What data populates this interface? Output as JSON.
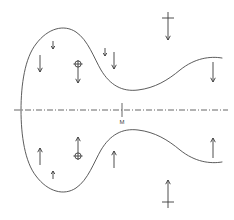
{
  "figure": {
    "background_color": "#ffffff",
    "curve_color": "#4a4a4a",
    "arrow_color": "#3a3a3a",
    "axis_color": "#555555",
    "width": 234,
    "height": 220
  },
  "axis": {
    "name": "horizontal-centerline",
    "style": "dash-dot",
    "y": 110,
    "x_start": 14,
    "x_end": 228,
    "tick": {
      "name": "center-tick",
      "x": 122,
      "half_height": 7
    },
    "label": {
      "text": "M",
      "x": 122,
      "y": 124
    }
  },
  "chart_data": {
    "type": "line",
    "xlabel": "",
    "ylabel": "",
    "xlim": [
      0,
      234
    ],
    "ylim": [
      0,
      220
    ],
    "grid": false,
    "legend": null,
    "annotations": [
      {
        "text": "M",
        "x": 122,
        "y": 124
      }
    ],
    "series": [
      {
        "name": "upper-boundary-curve",
        "path": "M 21,110 C 21,84 25,58 36,44 C 48,28 64,24 76,32 C 88,40 94,58 101,70 C 110,85 122,92 138,90 C 155,88 168,80 180,70 C 195,58 210,56 222,58",
        "points": [
          [
            21,
            110
          ],
          [
            24,
            88
          ],
          [
            30,
            66
          ],
          [
            40,
            47
          ],
          [
            54,
            36
          ],
          [
            68,
            33
          ],
          [
            80,
            40
          ],
          [
            90,
            54
          ],
          [
            99,
            68
          ],
          [
            110,
            81
          ],
          [
            124,
            89
          ],
          [
            140,
            89
          ],
          [
            156,
            84
          ],
          [
            172,
            74
          ],
          [
            190,
            63
          ],
          [
            206,
            57
          ],
          [
            222,
            58
          ]
        ]
      },
      {
        "name": "lower-boundary-curve",
        "path": "M 21,110 C 21,136 25,162 36,176 C 48,192 64,196 76,188 C 88,180 94,162 101,150 C 110,135 122,128 138,130 C 155,132 168,140 180,150 C 195,162 210,164 222,162",
        "points": [
          [
            21,
            110
          ],
          [
            24,
            132
          ],
          [
            30,
            154
          ],
          [
            40,
            173
          ],
          [
            54,
            184
          ],
          [
            68,
            187
          ],
          [
            80,
            180
          ],
          [
            90,
            166
          ],
          [
            99,
            152
          ],
          [
            110,
            139
          ],
          [
            124,
            131
          ],
          [
            140,
            131
          ],
          [
            156,
            136
          ],
          [
            172,
            146
          ],
          [
            190,
            157
          ],
          [
            206,
            163
          ],
          [
            222,
            162
          ]
        ]
      }
    ]
  },
  "arrows": [
    {
      "name": "arrow-upper-left-small-down",
      "kind": "small-down-arrow",
      "direction": "down",
      "x": 53,
      "y_top": 41,
      "length": 8,
      "crossbar": false,
      "circle": false
    },
    {
      "name": "arrow-upper-left-down",
      "kind": "plain-down-arrow",
      "direction": "down",
      "x": 40,
      "y_top": 55,
      "length": 17,
      "crossbar": false,
      "circle": false
    },
    {
      "name": "arrow-upper-mid-circle-down",
      "kind": "circled-down-arrow",
      "direction": "down",
      "x": 78,
      "y_top": 60,
      "length": 23,
      "crossbar": false,
      "circle": true,
      "circle_offset": 4
    },
    {
      "name": "arrow-upper-center-small-down",
      "kind": "small-down-arrow",
      "direction": "down",
      "x": 105,
      "y_top": 48,
      "length": 8,
      "crossbar": false,
      "circle": false
    },
    {
      "name": "arrow-upper-center-down",
      "kind": "plain-down-arrow",
      "direction": "down",
      "x": 114,
      "y_top": 52,
      "length": 17,
      "crossbar": false,
      "circle": false
    },
    {
      "name": "arrow-top-outer-crossed-down",
      "kind": "crossed-down-arrow",
      "direction": "down",
      "x": 168,
      "y_top": 12,
      "length": 28,
      "crossbar": true,
      "crossbar_offset": 6,
      "crossbar_width": 12,
      "circle": false
    },
    {
      "name": "arrow-upper-right-down",
      "kind": "plain-down-arrow",
      "direction": "down",
      "x": 213,
      "y_top": 62,
      "length": 20,
      "crossbar": false,
      "circle": false
    },
    {
      "name": "arrow-lower-left-small-up",
      "kind": "small-up-arrow",
      "direction": "up",
      "x": 53,
      "y_top": 171,
      "length": 8,
      "crossbar": false,
      "circle": false
    },
    {
      "name": "arrow-lower-left-up",
      "kind": "plain-up-arrow",
      "direction": "up",
      "x": 40,
      "y_top": 148,
      "length": 17,
      "crossbar": false,
      "circle": false
    },
    {
      "name": "arrow-lower-mid-circle-up",
      "kind": "circled-up-arrow",
      "direction": "up",
      "x": 78,
      "y_top": 137,
      "length": 23,
      "crossbar": false,
      "circle": true,
      "circle_offset": 19
    },
    {
      "name": "arrow-lower-center-up",
      "kind": "plain-up-arrow",
      "direction": "up",
      "x": 114,
      "y_top": 151,
      "length": 17,
      "crossbar": false,
      "circle": false
    },
    {
      "name": "arrow-bottom-outer-crossed-up",
      "kind": "crossed-up-arrow",
      "direction": "up",
      "x": 168,
      "y_top": 180,
      "length": 28,
      "crossbar": true,
      "crossbar_offset": 22,
      "crossbar_width": 12,
      "circle": false
    },
    {
      "name": "arrow-lower-right-up",
      "kind": "plain-up-arrow",
      "direction": "up",
      "x": 213,
      "y_top": 138,
      "length": 20,
      "crossbar": false,
      "circle": false
    }
  ]
}
